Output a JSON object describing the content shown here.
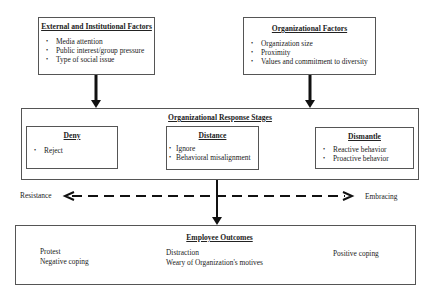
{
  "external_factors": {
    "title": "External and Institutional Factors",
    "items": [
      "Media attention",
      "Public interest/group pressure",
      "Type of social issue"
    ]
  },
  "organizational_factors": {
    "title": "Organizational Factors",
    "items": [
      "Organization size",
      "Proximity",
      "Values and commitment to diversity"
    ]
  },
  "response_stages": {
    "title": "Organizational Response Stages",
    "stages": [
      {
        "title": "Deny",
        "items": [
          "Reject"
        ]
      },
      {
        "title": "Distance",
        "items": [
          "Ignore",
          "Behavioral misalignment"
        ]
      },
      {
        "title": "Dismantle",
        "items": [
          "Reactive behavior",
          "Proactive behavior"
        ]
      }
    ]
  },
  "continuum": {
    "left_label": "Resistance",
    "right_label": "Embracing"
  },
  "employee_outcomes": {
    "title": "Employee Outcomes",
    "columns": [
      [
        "Protest",
        "Negative coping"
      ],
      [
        "Distraction",
        "Weary of Organization's motives"
      ],
      [
        "Positive coping"
      ]
    ]
  }
}
